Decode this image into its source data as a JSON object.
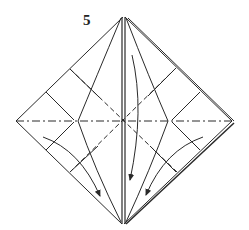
{
  "diagram": {
    "step_number": "5",
    "colors": {
      "line": "#2a2a2a",
      "background": "#ffffff"
    },
    "shape": "square base diamond",
    "vertices": {
      "top": [
        123,
        17
      ],
      "left": [
        16,
        121
      ],
      "right": [
        232,
        121
      ],
      "bottom": [
        122,
        224
      ],
      "center": [
        123,
        121
      ]
    },
    "fold_lines": {
      "mountain_horizontal": "left-to-right dash-dot line through center",
      "valley_diagonals": "dashed lines from edge quarter points through center"
    },
    "arrows": [
      {
        "name": "left-flap-arrow",
        "direction": "down-right"
      },
      {
        "name": "center-flap-arrow",
        "direction": "down"
      },
      {
        "name": "right-flap-arrow",
        "direction": "down-left"
      }
    ]
  }
}
